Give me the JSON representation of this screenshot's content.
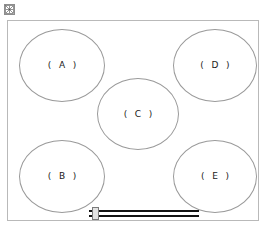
{
  "document": {
    "title": "Cooktop Burner Layout Diagram",
    "background_color": "#ffffff"
  },
  "placeholder": {
    "icon": "broken-image-icon",
    "border_color": "#8d8d8d",
    "fill_color": "#f2f2f2"
  },
  "cooktop": {
    "frame_label": "cooktop-surface",
    "border_color": "#b9b9b9",
    "burner_outline_color": "#9a9a9a",
    "burners": [
      {
        "id": "a",
        "label": "( A )",
        "letter": "A"
      },
      {
        "id": "b",
        "label": "( B )",
        "letter": "B"
      },
      {
        "id": "c",
        "label": "( C )",
        "letter": "C"
      },
      {
        "id": "d",
        "label": "( D )",
        "letter": "D"
      },
      {
        "id": "e",
        "label": "( E )",
        "letter": "E"
      }
    ]
  },
  "control": {
    "name": "slider-control",
    "track_color": "#121212",
    "handle_color": "#e2e2e2"
  }
}
